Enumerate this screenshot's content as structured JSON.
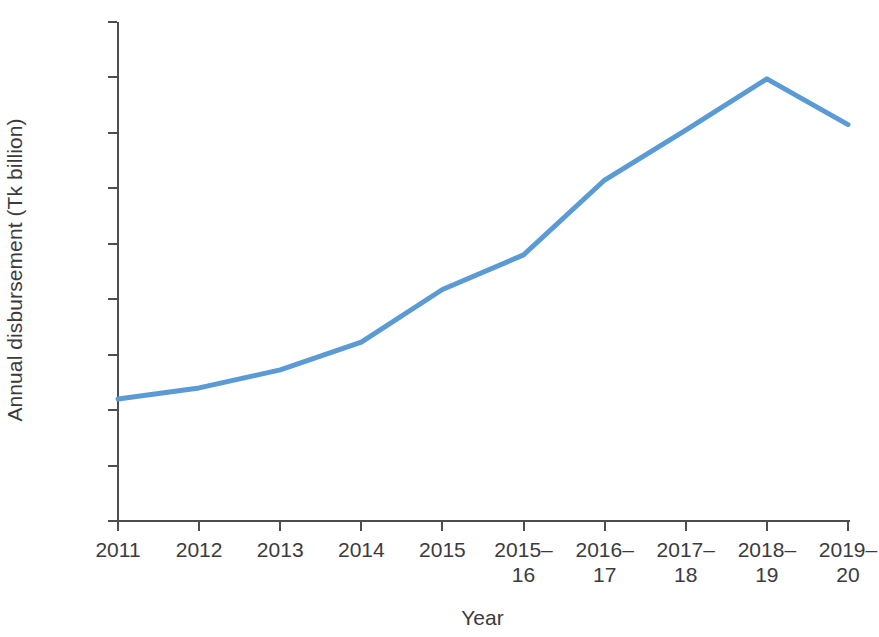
{
  "chart_data": {
    "type": "line",
    "title": "",
    "xlabel": "Year",
    "ylabel": "Annual disbursement (Tk billion)",
    "categories": [
      "2011",
      "2012",
      "2013",
      "2014",
      "2015",
      "2015–16",
      "2016–17",
      "2017–18",
      "2018–19",
      "2019–20"
    ],
    "values": [
      440,
      480,
      545,
      645,
      835,
      960,
      1230,
      1410,
      1595,
      1430
    ],
    "series": [
      {
        "name": "Annual disbursement",
        "values": [
          440,
          480,
          545,
          645,
          835,
          960,
          1230,
          1410,
          1595,
          1430
        ],
        "color": "#5B9BD5"
      }
    ],
    "ylim": [
      0,
      1800
    ],
    "yticks": [
      0,
      200,
      400,
      600,
      800,
      1000,
      1200,
      1400,
      1600,
      1800
    ],
    "ytick_labels": [
      "0",
      "200",
      "400",
      "600",
      "800",
      "1,000",
      "1,200",
      "1,400",
      "1,600",
      "1,800"
    ],
    "grid": false,
    "legend": false,
    "legend_position": "none",
    "line_color": "#5B9BD5",
    "axis_color": "#4D4D4D",
    "background_color": "#FFFFFF",
    "markers": false
  }
}
